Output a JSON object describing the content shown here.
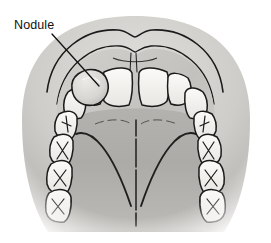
{
  "figure": {
    "domain": "Natural-Image",
    "kind": "medical-illustration",
    "view": "occlusal view of upper jaw, palate and upper lip",
    "style": "grayscale pen-and-ink with halftone shading",
    "width_px": 271,
    "height_px": 243,
    "background_color": "#ffffff"
  },
  "annotations": [
    {
      "id": "nodule",
      "label": "Nodule",
      "label_x": 14,
      "label_y": 18,
      "leader_from_x": 52,
      "leader_from_y": 34,
      "leader_to_x": 99,
      "leader_to_y": 86,
      "points_to": "rounded swelling on the labial surface of the left lateral incisor / canine region"
    }
  ],
  "anatomy": {
    "parts": [
      {
        "name": "upper-lip",
        "description": "upper lip with cupid's bow, outermost arch"
      },
      {
        "name": "labial-vestibule",
        "description": "shaded band between lip and gingiva"
      },
      {
        "name": "gingiva",
        "description": "gum tissue arch surrounding the teeth"
      },
      {
        "name": "labial-frenum",
        "description": "small midline fold above the central incisors"
      },
      {
        "name": "hard-palate",
        "description": "broad shaded roof of the mouth"
      },
      {
        "name": "palatine-raphe",
        "description": "thin dark midline ridge running back along the palate"
      },
      {
        "name": "palatine-rugae",
        "description": "faint transverse folds behind the incisors"
      },
      {
        "name": "soft-palate-arch",
        "description": "dark inverted-V arch at the posterior palate"
      },
      {
        "name": "nodule",
        "description": "rounded pale swelling on the left anterior gingiva"
      }
    ],
    "teeth": {
      "count_visible": 14,
      "types": [
        "central-incisor",
        "central-incisor",
        "lateral-incisor",
        "lateral-incisor",
        "canine",
        "canine",
        "premolar",
        "premolar",
        "premolar",
        "premolar",
        "molar",
        "molar",
        "molar",
        "molar"
      ],
      "occlusal_marking": "X-shaped fissure lines on posterior teeth",
      "crown_fill": "#f2f0ec",
      "outline_color": "#1a1a1a"
    }
  },
  "colors": {
    "ink": "#1a1a1a",
    "tooth": "#f2f0ec",
    "lip_light": "#d6d4d0",
    "lip_mid": "#b9b7b3",
    "gingiva": "#c9c7c3",
    "palate_light": "#bbb9b5",
    "palate_mid": "#a8a6a2",
    "palate_dark": "#8e8c88",
    "nodule": "#dedcd8",
    "background": "#ffffff",
    "label_text": "#111111"
  }
}
